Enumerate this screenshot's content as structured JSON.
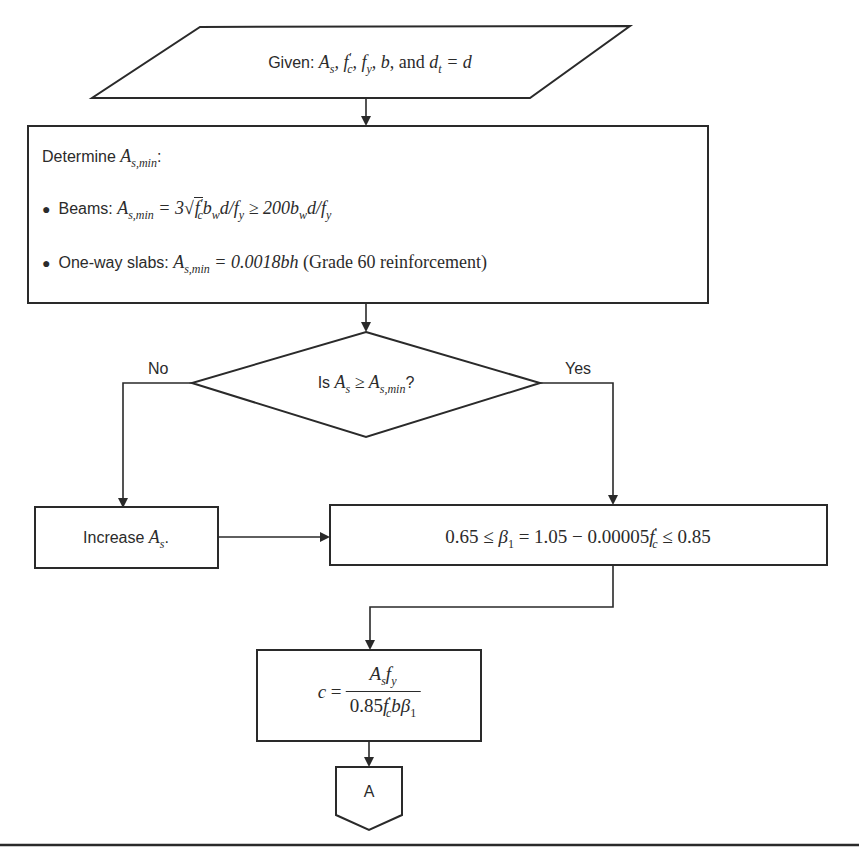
{
  "input_step": {
    "prefix": "Given: ",
    "math": "A_s, f'_c, f_y, b, and d_t = d",
    "parts": [
      "A",
      "s",
      ", ",
      "f",
      "′",
      "c",
      ", ",
      "f",
      "y",
      ", ",
      "b",
      ", and ",
      "d",
      "t",
      " = ",
      "d"
    ]
  },
  "determine_step": {
    "title_prefix": "Determine ",
    "title_math_base": "A",
    "title_math_sub": "s,min",
    "title_suffix": ":",
    "bullets": [
      {
        "label": "Beams: ",
        "formula": "A_s,min = 3√(f'_c) b_w d / f_y ≥ 200 b_w d / f_y"
      },
      {
        "label": "One-way slabs: ",
        "formula": "A_s,min = 0.0018bh",
        "note": "(Grade 60 reinforcement)"
      }
    ]
  },
  "decision": {
    "prefix": "Is ",
    "formula": "A_s ≥ A_s,min",
    "suffix": "?",
    "no_label": "No",
    "yes_label": "Yes"
  },
  "increase_step": {
    "prefix": "Increase ",
    "math_base": "A",
    "math_sub": "s",
    "suffix": "."
  },
  "beta_step": {
    "formula": "0.65 ≤ β_1 = 1.05 − 0.00005 f'_c ≤ 0.85"
  },
  "c_step": {
    "formula": "c = A_s f_y / (0.85 f'_c b β_1)"
  },
  "connector": {
    "label": "A"
  },
  "colors": {
    "stroke": "#2a2a2a",
    "text": "#2b2b2b",
    "background": "#ffffff"
  }
}
